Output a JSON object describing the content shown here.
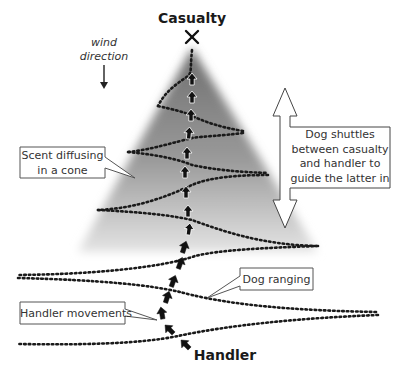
{
  "diagram": {
    "title_top": "Casualty",
    "title_bottom": "Handler",
    "wind": {
      "line1": "wind",
      "line2": "direction"
    },
    "callouts": {
      "scent": {
        "line1": "Scent diffusing",
        "line2": "in a cone"
      },
      "shuttle": {
        "line1": "Dog shuttles",
        "line2": "between casualty",
        "line3": "and handler to",
        "line4": "guide the latter in"
      },
      "ranging": "Dog ranging",
      "handler": "Handler movements"
    },
    "icons": {
      "casualty_marker": "cross-icon",
      "wind_arrow": "arrow-down-icon",
      "double_arrow": "double-arrow-vertical-icon",
      "path_arrows": "arrow-up-icon"
    },
    "colors": {
      "ink": "#1a1a1a",
      "cone_dark": "#7a7a7a",
      "cone_light": "#ffffff"
    }
  }
}
